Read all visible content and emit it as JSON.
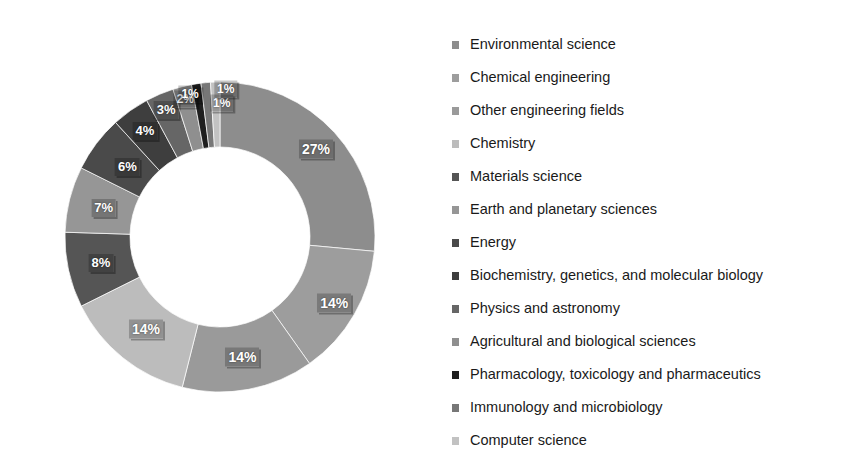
{
  "chart_data": {
    "type": "pie",
    "variant": "donut",
    "title": "",
    "subtitle": "",
    "xlabel": "",
    "ylabel": "",
    "grid": false,
    "legend_position": "right",
    "value_unit": "percent",
    "hole_ratio": 0.58,
    "start_angle_deg": 0,
    "direction": "clockwise",
    "categories": [
      "Environmental science",
      "Chemical engineering",
      "Other engineering fields",
      "Chemistry",
      "Materials science",
      "Earth and planetary sciences",
      "Energy",
      "Biochemistry, genetics, and molecular biology",
      "Physics and astronomy",
      "Agricultural and biological sciences",
      "Pharmacology, toxicology and pharmaceutics",
      "Immunology and microbiology",
      "Computer science"
    ],
    "values": [
      27,
      14,
      14,
      14,
      8,
      7,
      6,
      4,
      3,
      2,
      1,
      1,
      1
    ],
    "labels": [
      "27%",
      "14%",
      "14%",
      "14%",
      "8%",
      "7%",
      "6%",
      "4%",
      "3%",
      "2%",
      "1%",
      "1%",
      "1%"
    ],
    "colors": [
      "#8d8d8d",
      "#9d9d9d",
      "#9a9a9a",
      "#bcbcbc",
      "#555555",
      "#969696",
      "#4a4a4a",
      "#3e3e3e",
      "#666666",
      "#8f8f8f",
      "#1f1f1f",
      "#777777",
      "#c2c2c2"
    ]
  },
  "legend": {
    "items": [
      {
        "label": "Environmental science",
        "color": "#8d8d8d"
      },
      {
        "label": "Chemical engineering",
        "color": "#9d9d9d"
      },
      {
        "label": "Other engineering fields",
        "color": "#9a9a9a"
      },
      {
        "label": "Chemistry",
        "color": "#bcbcbc"
      },
      {
        "label": "Materials science",
        "color": "#555555"
      },
      {
        "label": "Earth and planetary sciences",
        "color": "#969696"
      },
      {
        "label": "Energy",
        "color": "#4a4a4a"
      },
      {
        "label": "Biochemistry, genetics, and molecular biology",
        "color": "#3e3e3e"
      },
      {
        "label": "Physics and astronomy",
        "color": "#666666"
      },
      {
        "label": "Agricultural and biological sciences",
        "color": "#8f8f8f"
      },
      {
        "label": "Pharmacology, toxicology and pharmaceutics",
        "color": "#1f1f1f"
      },
      {
        "label": "Immunology and microbiology",
        "color": "#777777"
      },
      {
        "label": "Computer science",
        "color": "#c2c2c2"
      }
    ]
  },
  "geometry": {
    "center_x": 220,
    "center_y": 237,
    "outer_radius": 155,
    "inner_radius": 90,
    "label_radius": 124
  }
}
